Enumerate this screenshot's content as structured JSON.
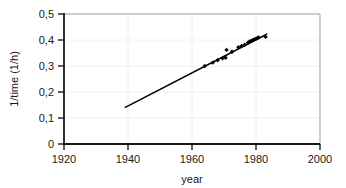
{
  "chart_data": {
    "type": "scatter",
    "title": "",
    "xlabel": "year",
    "ylabel": "1/time  (1/h)",
    "xlim": [
      1920,
      2000
    ],
    "ylim": [
      0,
      0.5
    ],
    "grid": true,
    "legend": null,
    "xticks": [
      1920,
      1940,
      1960,
      1980,
      2000
    ],
    "xtick_labels": [
      "1920",
      "1940",
      "1960",
      "1980",
      "2000"
    ],
    "yticks": [
      0,
      0.1,
      0.2,
      0.3,
      0.4,
      0.5
    ],
    "ytick_labels": [
      "0",
      "0,1",
      "0,2",
      "0,3",
      "0,4",
      "0,5"
    ],
    "decimal_separator": ",",
    "series": [
      {
        "name": "data points",
        "marker": "diamond",
        "color": "#000000",
        "x": [
          1964,
          1966.5,
          1968,
          1969.5,
          1970.5,
          1970.8,
          1972.5,
          1974.5,
          1975.5,
          1976.5,
          1977.5,
          1978,
          1978.6,
          1979.2,
          1979.8,
          1980.3,
          1980.8,
          1983
        ],
        "y": [
          0.3,
          0.313,
          0.322,
          0.33,
          0.332,
          0.362,
          0.355,
          0.372,
          0.377,
          0.382,
          0.39,
          0.394,
          0.397,
          0.401,
          0.404,
          0.407,
          0.41,
          0.412
        ]
      },
      {
        "name": "linear fit",
        "marker": "none",
        "color": "#000000",
        "x": [
          1939,
          1983.5
        ],
        "y": [
          0.14,
          0.423
        ]
      }
    ]
  },
  "axes": {
    "x_axis_name": "x-axis",
    "y_axis_name": "y-axis"
  }
}
